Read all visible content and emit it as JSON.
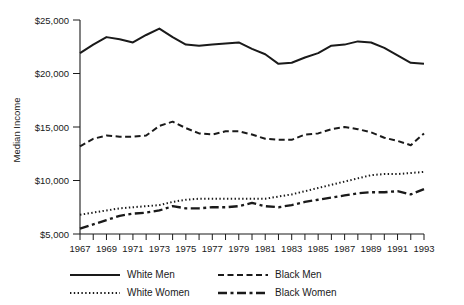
{
  "chart_data": {
    "type": "line",
    "title": "",
    "xlabel": "",
    "ylabel": "Median Income",
    "ylim": [
      5000,
      25000
    ],
    "yticks": [
      5000,
      10000,
      15000,
      20000,
      25000
    ],
    "ytick_labels": [
      "$5,000",
      "$10,000",
      "$15,000",
      "$20,000",
      "$25,000"
    ],
    "grid": false,
    "legend_position": "bottom",
    "x": [
      1967,
      1968,
      1969,
      1970,
      1971,
      1972,
      1973,
      1974,
      1975,
      1976,
      1977,
      1978,
      1979,
      1980,
      1981,
      1982,
      1983,
      1984,
      1985,
      1986,
      1987,
      1988,
      1989,
      1990,
      1991,
      1992,
      1993
    ],
    "xtick_labels": [
      "1967",
      "",
      "1969",
      "",
      "1971",
      "",
      "1973",
      "",
      "1975",
      "",
      "1977",
      "",
      "1979",
      "",
      "1981",
      "",
      "1983",
      "",
      "1985",
      "",
      "1987",
      "",
      "1989",
      "",
      "1991",
      "",
      "1993"
    ],
    "xtick_labels_shown": [
      "1967",
      "1969",
      "1971",
      "1973",
      "1975",
      "1977",
      "1979",
      "1981",
      "1983",
      "1985",
      "1987",
      "1989",
      "1991",
      "1993"
    ],
    "series": [
      {
        "name": "White Men",
        "style": "solid",
        "values": [
          21900,
          22700,
          23400,
          23200,
          22900,
          23600,
          24200,
          23400,
          22700,
          22600,
          22700,
          22800,
          22900,
          22300,
          21800,
          20900,
          21000,
          21500,
          21900,
          22600,
          22700,
          23000,
          22900,
          22400,
          21700,
          21000,
          20900
        ]
      },
      {
        "name": "Black Men",
        "style": "dashed",
        "values": [
          13200,
          13900,
          14200,
          14100,
          14100,
          14200,
          15100,
          15500,
          14900,
          14400,
          14300,
          14600,
          14600,
          14300,
          13900,
          13800,
          13800,
          14300,
          14400,
          14800,
          15000,
          14800,
          14500,
          14000,
          13700,
          13300,
          14400
        ]
      },
      {
        "name": "White Women",
        "style": "dotted",
        "values": [
          6800,
          7000,
          7200,
          7400,
          7500,
          7600,
          7700,
          8000,
          8200,
          8300,
          8300,
          8300,
          8300,
          8300,
          8300,
          8500,
          8700,
          9000,
          9300,
          9600,
          9900,
          10200,
          10500,
          10600,
          10600,
          10700,
          10800
        ]
      },
      {
        "name": "Black Women",
        "style": "dashdot",
        "values": [
          5500,
          5900,
          6300,
          6700,
          6900,
          7000,
          7200,
          7600,
          7400,
          7400,
          7500,
          7500,
          7600,
          7900,
          7600,
          7500,
          7700,
          8000,
          8200,
          8400,
          8600,
          8800,
          8900,
          8900,
          9000,
          8700,
          9200
        ]
      }
    ]
  },
  "axes": {
    "y_axis_label": "Median Income"
  },
  "legend": {
    "items": [
      {
        "label": "White Men",
        "style": "solid"
      },
      {
        "label": "Black Men",
        "style": "dashed"
      },
      {
        "label": "White Women",
        "style": "dotted"
      },
      {
        "label": "Black Women",
        "style": "dashdot"
      }
    ]
  },
  "colors": {
    "ink": "#1a1a1a",
    "background": "#ffffff"
  }
}
